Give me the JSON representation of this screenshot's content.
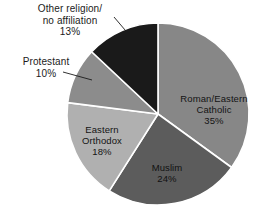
{
  "chart_data": {
    "type": "pie",
    "title": "",
    "categories": [
      "Roman/Eastern Catholic",
      "Muslim",
      "Eastern Orthodox",
      "Protestant",
      "Other religion/no affiliation"
    ],
    "values": [
      35,
      24,
      18,
      10,
      13
    ],
    "value_unit": "%",
    "start_angle_deg": 0,
    "direction": "clockwise",
    "legend": "none",
    "grid": false,
    "slices": [
      {
        "label": "Roman/Eastern Catholic",
        "label_line1": "Roman/Eastern",
        "label_line2": "Catholic",
        "value": 35,
        "value_text": "35%",
        "color": "#878787",
        "label_placement": "inside"
      },
      {
        "label": "Muslim",
        "label_line1": "Muslim",
        "label_line2": "",
        "value": 24,
        "value_text": "24%",
        "color": "#5c5c5c",
        "label_placement": "inside"
      },
      {
        "label": "Eastern Orthodox",
        "label_line1": "Eastern",
        "label_line2": "Orthodox",
        "value": 18,
        "value_text": "18%",
        "color": "#b0b0b0",
        "label_placement": "inside"
      },
      {
        "label": "Protestant",
        "label_line1": "Protestant",
        "label_line2": "",
        "value": 10,
        "value_text": "10%",
        "color": "#8c8c8c",
        "label_placement": "outside"
      },
      {
        "label": "Other religion/no affiliation",
        "label_line1": "Other religion/",
        "label_line2": "no affiliation",
        "value": 13,
        "value_text": "13%",
        "color": "#1a1a1a",
        "label_placement": "outside"
      }
    ]
  },
  "colors": {
    "background": "#ffffff",
    "slice_border": "#ffffff",
    "text": "#1b1b1b",
    "leader_line": "#1b1b1b"
  }
}
